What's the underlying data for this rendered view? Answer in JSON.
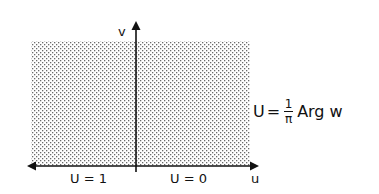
{
  "diagram": {
    "region": {
      "description": "upper half-plane (shaded)",
      "fill_pattern": "dots",
      "dot_color": "#555555"
    },
    "axes": {
      "vertical_label": "v",
      "horizontal_label": "u"
    },
    "boundary_labels": {
      "left": "U = 1",
      "right": "U = 0"
    },
    "formula": {
      "lhs": "U",
      "equals": "=",
      "numerator": "1",
      "denominator": "π",
      "rhs": "Arg w"
    }
  }
}
